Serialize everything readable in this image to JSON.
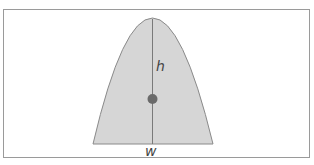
{
  "diagram": {
    "type": "parabolic-segment",
    "labels": {
      "height": "h",
      "width": "w"
    },
    "colors": {
      "frame": "#9a9a9a",
      "fill": "#d6d6d6",
      "outline": "#8a8a8a",
      "axis": "#7a7a7a",
      "centroid": "#6a6a6a"
    }
  }
}
